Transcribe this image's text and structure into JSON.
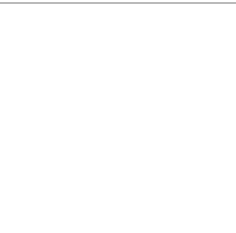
{
  "diagram": {
    "type": "go-board-fragment",
    "top_rule_color": "#777777",
    "grid": {
      "x": [
        18,
        36,
        53,
        71,
        88,
        106,
        124,
        142,
        159,
        177,
        195,
        213
      ],
      "y": [
        18,
        34,
        52,
        70,
        88,
        106,
        124,
        145,
        163,
        181,
        200,
        218
      ],
      "right_extent": 225,
      "line_color": "#555555",
      "edge_color": "#222222"
    },
    "hoshi": [
      {
        "x": 71,
        "y": 52
      },
      {
        "x": 177,
        "y": 52
      },
      {
        "x": 177,
        "y": 163
      }
    ],
    "stones": [
      {
        "color": "black",
        "label": "",
        "x": 53,
        "y": 181
      },
      {
        "color": "white",
        "label": "1",
        "x": 71,
        "y": 163
      },
      {
        "color": "black",
        "label": "2",
        "x": 71,
        "y": 181
      },
      {
        "color": "white",
        "label": "3",
        "x": 106,
        "y": 163
      },
      {
        "color": "black",
        "label": "4",
        "x": 88,
        "y": 163
      },
      {
        "color": "white",
        "label": "5",
        "x": 88,
        "y": 145
      },
      {
        "color": "black",
        "label": "6",
        "x": 88,
        "y": 181
      },
      {
        "color": "white",
        "label": "7",
        "x": 106,
        "y": 145
      }
    ]
  }
}
